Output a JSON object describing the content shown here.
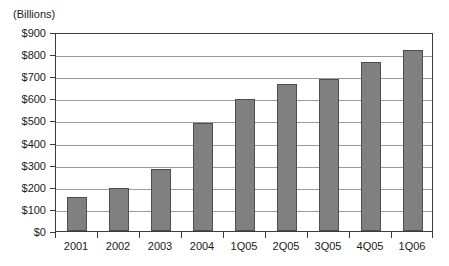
{
  "chart_data": {
    "type": "bar",
    "title": "",
    "subtitle": "",
    "unit_caption": "(Billions)",
    "xlabel": "",
    "ylabel": "",
    "categories": [
      "2001",
      "2002",
      "2003",
      "2004",
      "1Q05",
      "2Q05",
      "3Q05",
      "4Q05",
      "1Q06"
    ],
    "values": [
      155,
      195,
      282,
      490,
      598,
      665,
      688,
      765,
      820
    ],
    "ylim": [
      0,
      900
    ],
    "ytick_step": 100,
    "ytick_labels": [
      "$0",
      "$100",
      "$200",
      "$300",
      "$400",
      "$500",
      "$600",
      "$700",
      "$800",
      "$900"
    ],
    "ytick_values": [
      0,
      100,
      200,
      300,
      400,
      500,
      600,
      700,
      800,
      900
    ],
    "grid": true,
    "grid_axis": "y",
    "legend": false,
    "legend_position": "none",
    "series": [
      {
        "name": "Value",
        "values": [
          155,
          195,
          282,
          490,
          598,
          665,
          688,
          765,
          820
        ]
      }
    ],
    "annotations": []
  },
  "style": {
    "bar_fill": "#808080",
    "bar_stroke": "#4d4d4d",
    "gridline_color": "#9a9a9a",
    "axis_color": "#3c3c3c",
    "background": "#ffffff",
    "text_color": "#1a1a1a"
  }
}
